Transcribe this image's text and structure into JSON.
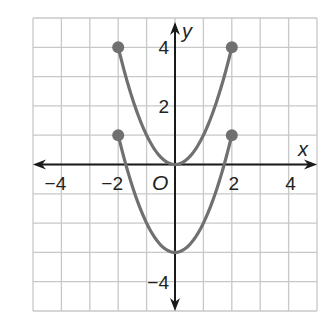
{
  "chart_data": {
    "type": "line",
    "title": "",
    "xlabel": "x",
    "ylabel": "y",
    "origin_label": "O",
    "xlim": [
      -5,
      5
    ],
    "ylim": [
      -5,
      5
    ],
    "grid": true,
    "grid_step": 1,
    "x_tick_labels": [
      {
        "value": -4,
        "label": "−4"
      },
      {
        "value": -2,
        "label": "−2"
      },
      {
        "value": 2,
        "label": "2"
      },
      {
        "value": 4,
        "label": "4"
      }
    ],
    "y_tick_labels": [
      {
        "value": 4,
        "label": "4"
      },
      {
        "value": 2,
        "label": "2"
      },
      {
        "value": -4,
        "label": "−4"
      }
    ],
    "series": [
      {
        "name": "y = x^2",
        "domain": [
          -2,
          2
        ],
        "x": [
          -2,
          -1.5,
          -1,
          -0.5,
          0,
          0.5,
          1,
          1.5,
          2
        ],
        "y": [
          4,
          2.25,
          1,
          0.25,
          0,
          0.25,
          1,
          2.25,
          4
        ],
        "endpoints": [
          [
            -2,
            4
          ],
          [
            2,
            4
          ]
        ],
        "endpoint_style": "closed"
      },
      {
        "name": "y = x^2 - 3",
        "domain": [
          -2,
          2
        ],
        "x": [
          -2,
          -1.5,
          -1,
          -0.5,
          0,
          0.5,
          1,
          1.5,
          2
        ],
        "y": [
          1,
          -0.75,
          -2,
          -2.75,
          -3,
          -2.75,
          -2,
          -0.75,
          1
        ],
        "endpoints": [
          [
            -2,
            1
          ],
          [
            2,
            1
          ]
        ],
        "endpoint_style": "closed"
      }
    ],
    "legend": "none"
  },
  "colors": {
    "curve": "#707070",
    "grid": "#c8c8c8",
    "axis": "#1a1a1a"
  }
}
